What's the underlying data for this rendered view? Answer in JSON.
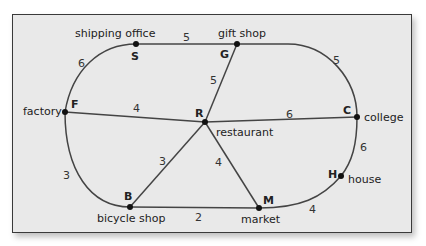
{
  "diagram": {
    "type": "weighted-graph-map",
    "nodes": [
      {
        "id": "S",
        "label": "shipping office",
        "x": 136,
        "y": 44
      },
      {
        "id": "G",
        "label": "gift shop",
        "x": 237,
        "y": 44
      },
      {
        "id": "C",
        "label": "college",
        "x": 357,
        "y": 117
      },
      {
        "id": "H",
        "label": "house",
        "x": 341,
        "y": 176
      },
      {
        "id": "M",
        "label": "market",
        "x": 259,
        "y": 208
      },
      {
        "id": "B",
        "label": "bicycle shop",
        "x": 130,
        "y": 207
      },
      {
        "id": "F",
        "label": "factory",
        "x": 65,
        "y": 112
      },
      {
        "id": "R",
        "label": "restaurant",
        "x": 205,
        "y": 122
      }
    ],
    "edges": [
      {
        "from": "S",
        "to": "G",
        "weight": "5"
      },
      {
        "from": "G",
        "to": "C",
        "weight": "5"
      },
      {
        "from": "C",
        "to": "H",
        "weight": "6"
      },
      {
        "from": "H",
        "to": "M",
        "weight": "4"
      },
      {
        "from": "M",
        "to": "B",
        "weight": "2"
      },
      {
        "from": "B",
        "to": "F",
        "weight": "3"
      },
      {
        "from": "F",
        "to": "S",
        "weight": "6"
      },
      {
        "from": "F",
        "to": "R",
        "weight": "4"
      },
      {
        "from": "G",
        "to": "R",
        "weight": "5"
      },
      {
        "from": "R",
        "to": "C",
        "weight": "6"
      },
      {
        "from": "R",
        "to": "B",
        "weight": "3"
      },
      {
        "from": "R",
        "to": "M",
        "weight": "4"
      }
    ]
  }
}
